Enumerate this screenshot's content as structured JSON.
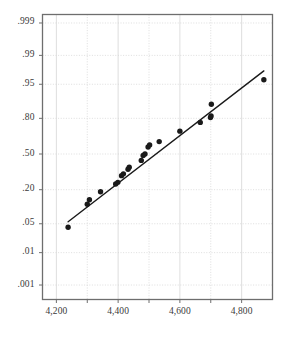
{
  "chart_data": {
    "type": "scatter",
    "title": "",
    "subtitle": "",
    "xlabel": "",
    "ylabel": "",
    "plot_kind": "normal-probability-plot",
    "grid": true,
    "legend": null,
    "xlim": [
      4155,
      4900
    ],
    "ylim_probability": [
      0.0003,
      0.9995
    ],
    "x_ticks": [
      4200,
      4400,
      4600,
      4800
    ],
    "x_tick_labels": [
      "4,200",
      "4,400",
      "4,600",
      "4,800"
    ],
    "x_minor_ticks": [
      4300,
      4500,
      4700
    ],
    "y_ticks": [
      0.001,
      0.01,
      0.05,
      0.2,
      0.5,
      0.8,
      0.95,
      0.99,
      0.999
    ],
    "y_tick_labels": [
      ".001",
      ".01",
      ".05",
      ".20",
      ".50",
      ".80",
      ".95",
      ".99",
      ".999"
    ],
    "marker": {
      "shape": "circle",
      "color": "#1a1a1a",
      "size_px": 5.4
    },
    "reference_line": {
      "color": "#1a1a1a",
      "width_px": 1.4,
      "x_start": 4238,
      "y_start": 0.055,
      "x_end": 4872,
      "y_end": 0.975
    },
    "points": [
      {
        "x": 4238,
        "y": 0.042
      },
      {
        "x": 4300,
        "y": 0.118
      },
      {
        "x": 4307,
        "y": 0.14
      },
      {
        "x": 4343,
        "y": 0.187
      },
      {
        "x": 4392,
        "y": 0.24
      },
      {
        "x": 4399,
        "y": 0.252
      },
      {
        "x": 4411,
        "y": 0.305
      },
      {
        "x": 4417,
        "y": 0.32
      },
      {
        "x": 4432,
        "y": 0.36
      },
      {
        "x": 4436,
        "y": 0.378
      },
      {
        "x": 4475,
        "y": 0.44
      },
      {
        "x": 4481,
        "y": 0.487
      },
      {
        "x": 4487,
        "y": 0.5
      },
      {
        "x": 4497,
        "y": 0.565
      },
      {
        "x": 4502,
        "y": 0.585
      },
      {
        "x": 4533,
        "y": 0.615
      },
      {
        "x": 4600,
        "y": 0.705
      },
      {
        "x": 4666,
        "y": 0.772
      },
      {
        "x": 4699,
        "y": 0.805
      },
      {
        "x": 4701,
        "y": 0.815
      },
      {
        "x": 4702,
        "y": 0.88
      },
      {
        "x": 4872,
        "y": 0.96
      }
    ],
    "colors": {
      "frame": "#6e6e6e",
      "grid": "#d6d6d6",
      "marker": "#1a1a1a",
      "line": "#1a1a1a",
      "tick_text": "#3a3a3a",
      "background": "#ffffff"
    }
  }
}
